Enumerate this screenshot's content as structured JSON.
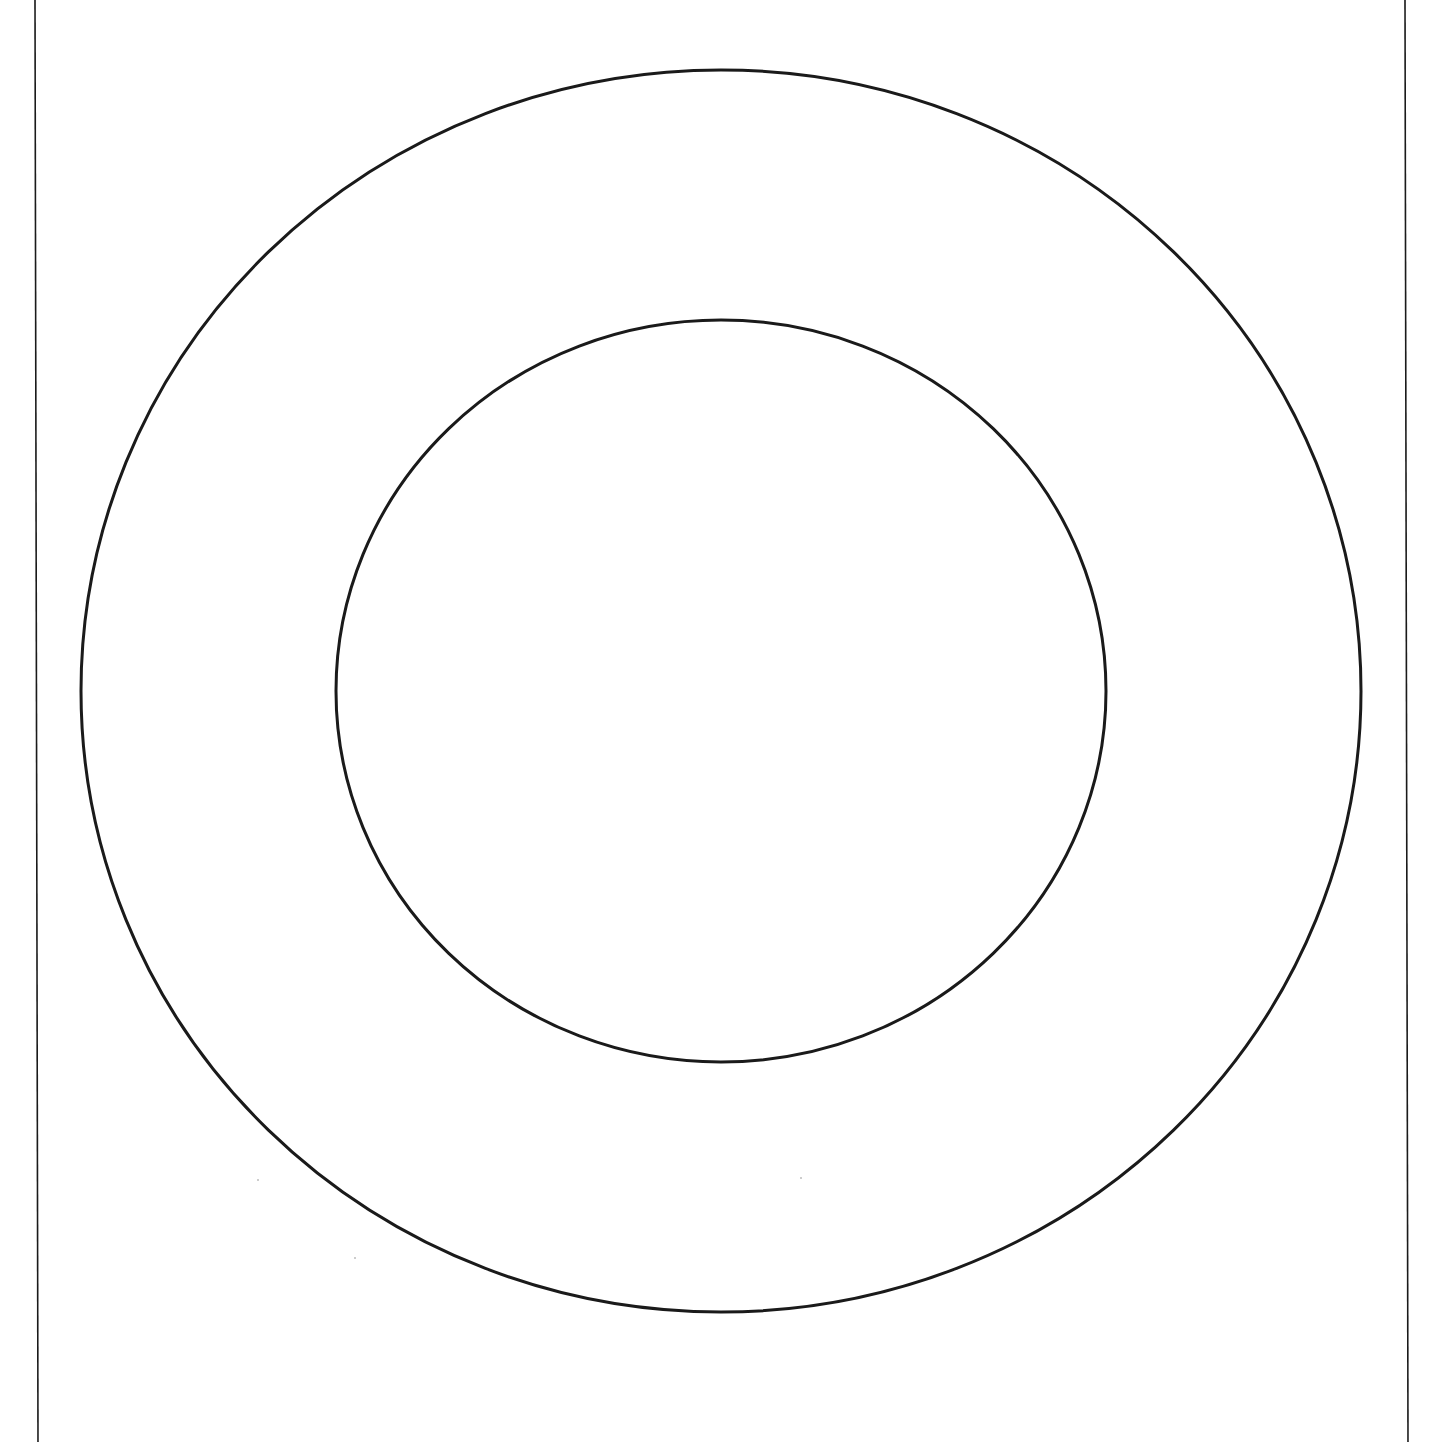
{
  "diagram": {
    "title": "",
    "background": "#ffffff",
    "stroke_color": "#1a1a1a",
    "border_lines": [
      {
        "id": "left-border-line",
        "x1": 35,
        "y1": 0,
        "x2": 38,
        "y2": 1442,
        "stroke_width": 1.6
      },
      {
        "id": "right-border-line",
        "x1": 1405,
        "y1": 0,
        "x2": 1408,
        "y2": 1442,
        "stroke_width": 1.6
      }
    ],
    "circles": [
      {
        "id": "outer-circle",
        "cx": 721,
        "cy": 691,
        "rx": 640,
        "ry": 621,
        "stroke_width": 3
      },
      {
        "id": "inner-circle",
        "cx": 721,
        "cy": 691,
        "rx": 385,
        "ry": 371,
        "stroke_width": 3
      }
    ],
    "specks": [
      {
        "id": "speck-1",
        "x": 258,
        "y": 1180,
        "r": 1
      },
      {
        "id": "speck-2",
        "x": 355,
        "y": 1258,
        "r": 1
      },
      {
        "id": "speck-3",
        "x": 801,
        "y": 1178,
        "r": 1
      }
    ]
  }
}
